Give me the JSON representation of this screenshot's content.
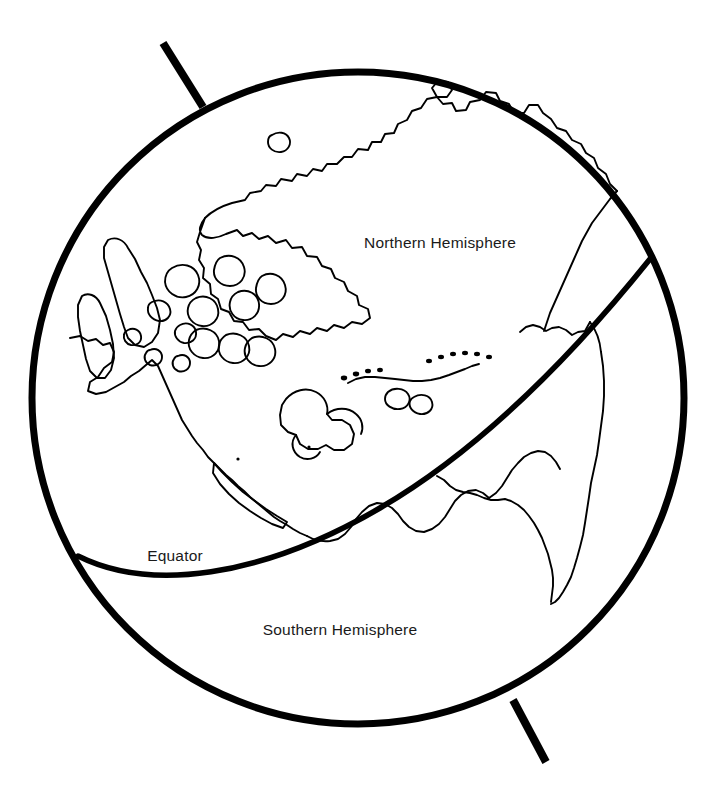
{
  "figure": {
    "background_color": "#ffffff",
    "line_color": "#000000",
    "text_color": "#1a1a1a"
  },
  "labels": {
    "northern": "Northern Hemisphere",
    "equator": "Equator",
    "southern": "Southern Hemisphere"
  },
  "geometry": {
    "globe_center_x": 358,
    "globe_center_y": 398,
    "globe_radius": 326,
    "globe_stroke_width": 7,
    "equator_stroke_width": 5.5,
    "coastline_stroke_width": 1.9,
    "axis_stroke_width": 8
  },
  "label_positions": {
    "northern_x": 440,
    "northern_y": 248,
    "equator_x": 175,
    "equator_y": 561,
    "southern_x": 340,
    "southern_y": 635
  },
  "features": [
    "globe-outline",
    "rotation-axis-north",
    "rotation-axis-south",
    "equator-line",
    "greenland-coastline",
    "arctic-islands",
    "north-america-coastline",
    "caribbean-islands",
    "south-america-coastline"
  ]
}
